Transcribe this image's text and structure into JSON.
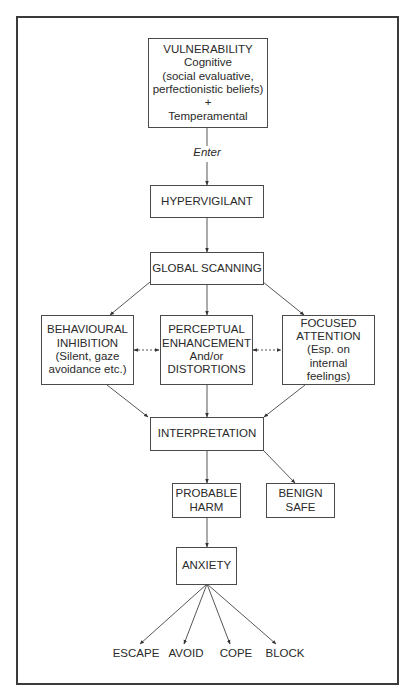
{
  "diagram": {
    "type": "flowchart",
    "nodes": {
      "vulnerability": {
        "lines": [
          "VULNERABILITY",
          "Cognitive",
          "(social evaluative,",
          "perfectionistic beliefs)",
          "+",
          "Temperamental"
        ]
      },
      "hypervigilant": {
        "lines": [
          "HYPERVIGILANT"
        ]
      },
      "global_scanning": {
        "lines": [
          "GLOBAL SCANNING"
        ]
      },
      "behavioural_inhibition": {
        "lines": [
          "BEHAVIOURAL",
          "INHIBITION",
          "(Silent, gaze",
          "avoidance etc.)"
        ]
      },
      "perceptual_enhancement": {
        "lines": [
          "PERCEPTUAL",
          "ENHANCEMENT",
          "And/or",
          "DISTORTIONS"
        ]
      },
      "focused_attention": {
        "lines": [
          "FOCUSED",
          "ATTENTION",
          "(Esp. on",
          "internal",
          "feelings)"
        ]
      },
      "interpretation": {
        "lines": [
          "INTERPRETATION"
        ]
      },
      "probable_harm": {
        "lines": [
          "PROBABLE",
          "HARM"
        ]
      },
      "benign_safe": {
        "lines": [
          "BENIGN",
          "SAFE"
        ]
      },
      "anxiety": {
        "lines": [
          "ANXIETY"
        ]
      }
    },
    "edge_labels": {
      "enter": "Enter"
    },
    "outcomes": [
      "ESCAPE",
      "AVOID",
      "COPE",
      "BLOCK"
    ],
    "edges": [
      {
        "from": "vulnerability",
        "to": "hypervigilant",
        "label": "Enter"
      },
      {
        "from": "hypervigilant",
        "to": "global_scanning"
      },
      {
        "from": "global_scanning",
        "to": "behavioural_inhibition"
      },
      {
        "from": "global_scanning",
        "to": "perceptual_enhancement"
      },
      {
        "from": "global_scanning",
        "to": "focused_attention"
      },
      {
        "from": "behavioural_inhibition",
        "to": "perceptual_enhancement",
        "style": "dashed",
        "bidirectional": true
      },
      {
        "from": "perceptual_enhancement",
        "to": "focused_attention",
        "style": "dashed",
        "bidirectional": true
      },
      {
        "from": "behavioural_inhibition",
        "to": "interpretation"
      },
      {
        "from": "perceptual_enhancement",
        "to": "interpretation"
      },
      {
        "from": "focused_attention",
        "to": "interpretation"
      },
      {
        "from": "interpretation",
        "to": "probable_harm"
      },
      {
        "from": "interpretation",
        "to": "benign_safe"
      },
      {
        "from": "probable_harm",
        "to": "anxiety"
      },
      {
        "from": "anxiety",
        "to": "ESCAPE"
      },
      {
        "from": "anxiety",
        "to": "AVOID"
      },
      {
        "from": "anxiety",
        "to": "COPE"
      },
      {
        "from": "anxiety",
        "to": "BLOCK"
      }
    ]
  }
}
